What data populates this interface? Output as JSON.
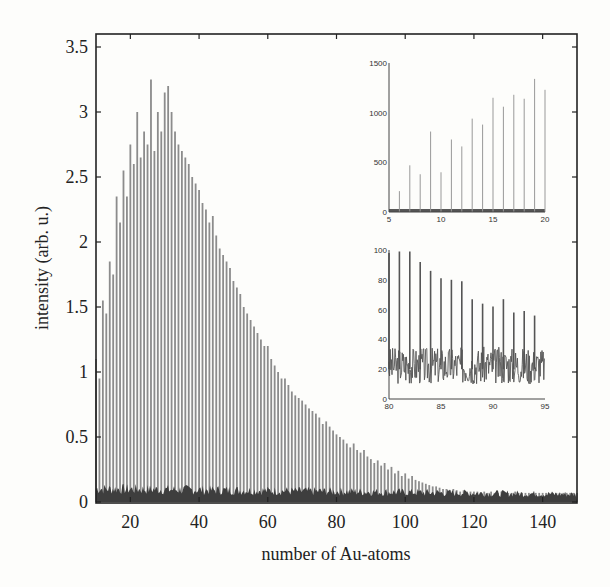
{
  "chart_data": [
    {
      "type": "bar",
      "title": "",
      "xlabel": "number of Au-atoms",
      "ylabel": "intensity (arb. u.)",
      "xlim": [
        10,
        150
      ],
      "ylim": [
        0,
        3.6
      ],
      "xticks": [
        20,
        40,
        60,
        80,
        100,
        120,
        140
      ],
      "yticks": [
        0,
        0.5,
        1,
        1.5,
        2,
        2.5,
        3,
        3.5
      ],
      "ytick_labels": [
        "0",
        "0.5",
        "1",
        "1.5",
        "2",
        "2.5",
        "3",
        "3.5"
      ],
      "grid": false,
      "legend": null,
      "x": [
        10,
        11,
        12,
        13,
        14,
        15,
        16,
        17,
        18,
        19,
        20,
        21,
        22,
        23,
        24,
        25,
        26,
        27,
        28,
        29,
        30,
        31,
        32,
        33,
        34,
        35,
        36,
        37,
        38,
        39,
        40,
        41,
        42,
        43,
        44,
        45,
        46,
        47,
        48,
        49,
        50,
        51,
        52,
        53,
        54,
        55,
        56,
        57,
        58,
        59,
        60,
        61,
        62,
        63,
        64,
        65,
        66,
        67,
        68,
        69,
        70,
        71,
        72,
        73,
        74,
        75,
        76,
        77,
        78,
        79,
        80,
        81,
        82,
        83,
        84,
        85,
        86,
        87,
        88,
        89,
        90,
        91,
        92,
        93,
        94,
        95,
        96,
        97,
        98,
        99,
        100,
        101,
        102,
        103,
        104,
        105,
        106,
        107,
        108,
        109,
        110,
        111,
        112,
        113,
        114,
        115,
        116,
        117,
        118,
        119,
        120,
        121,
        122,
        123,
        124,
        125,
        126,
        127,
        128,
        129,
        130,
        131,
        132,
        133,
        134,
        135,
        136,
        137,
        138,
        139,
        140,
        141,
        142,
        143,
        144,
        145,
        146,
        147,
        148,
        149,
        150
      ],
      "series": [
        {
          "name": "cluster peaks",
          "values": [
            1.1,
            0.95,
            1.55,
            1.45,
            1.85,
            1.75,
            2.35,
            2.15,
            2.55,
            2.35,
            2.75,
            2.6,
            3.0,
            2.65,
            2.85,
            2.75,
            3.25,
            2.7,
            3.0,
            2.85,
            3.15,
            3.2,
            3.0,
            2.85,
            2.75,
            2.7,
            2.65,
            2.6,
            2.5,
            2.45,
            2.4,
            2.3,
            2.25,
            2.15,
            2.2,
            2.05,
            1.95,
            1.9,
            1.85,
            1.8,
            1.7,
            1.65,
            1.6,
            1.5,
            1.45,
            1.4,
            1.35,
            1.3,
            1.25,
            1.2,
            1.2,
            1.1,
            1.05,
            1.0,
            0.95,
            0.95,
            0.9,
            0.85,
            0.82,
            0.8,
            0.78,
            0.75,
            0.72,
            0.7,
            0.68,
            0.65,
            0.6,
            0.62,
            0.58,
            0.55,
            0.52,
            0.5,
            0.48,
            0.45,
            0.42,
            0.45,
            0.4,
            0.38,
            0.4,
            0.35,
            0.33,
            0.3,
            0.32,
            0.28,
            0.3,
            0.25,
            0.27,
            0.22,
            0.24,
            0.2,
            0.22,
            0.18,
            0.2,
            0.17,
            0.16,
            0.15,
            0.14,
            0.13,
            0.12,
            0.12,
            0.11,
            0.1,
            0.1,
            0.09,
            0.1,
            0.09,
            0.08,
            0.09,
            0.08,
            0.08,
            0.08,
            0.08,
            0.07,
            0.08,
            0.07,
            0.08,
            0.07,
            0.07,
            0.08,
            0.07,
            0.07,
            0.07,
            0.08,
            0.07,
            0.07,
            0.07,
            0.07,
            0.07,
            0.07,
            0.07,
            0.07,
            0.07,
            0.07,
            0.07,
            0.07,
            0.07,
            0.07,
            0.07,
            0.07,
            0.07,
            0.07
          ]
        },
        {
          "name": "background",
          "values_approx": 0.1
        }
      ]
    },
    {
      "type": "line",
      "title": "inset top",
      "xlim": [
        5,
        20
      ],
      "ylim": [
        0,
        1500
      ],
      "xticks": [
        5,
        10,
        15,
        20
      ],
      "yticks": [
        0,
        500,
        1000,
        1500
      ],
      "x": [
        6,
        7,
        8,
        9,
        10,
        11,
        12,
        13,
        14,
        15,
        16,
        17,
        18,
        19,
        20
      ],
      "peaks": [
        210,
        470,
        380,
        810,
        400,
        730,
        660,
        940,
        880,
        1150,
        1060,
        1180,
        1140,
        1340,
        1230
      ],
      "baseline": 30
    },
    {
      "type": "line",
      "title": "inset bottom",
      "xlim": [
        80,
        95
      ],
      "ylim": [
        0,
        100
      ],
      "xticks": [
        80,
        85,
        90,
        95
      ],
      "yticks": [
        0,
        20,
        40,
        60,
        80,
        100
      ],
      "x": [
        80,
        81,
        82,
        83,
        84,
        85,
        86,
        87,
        88,
        89,
        90,
        91,
        92,
        93,
        94
      ],
      "peaks": [
        98,
        99,
        99,
        92,
        86,
        81,
        80,
        79,
        67,
        64,
        62,
        67,
        58,
        59,
        56
      ],
      "baseline_range": [
        10,
        35
      ]
    }
  ],
  "axes": {
    "xlabel": "number of Au-atoms",
    "ylabel": "intensity (arb. u.)"
  },
  "colors": {
    "bar": "#8a8a8a",
    "background_noise": "#3c3c3c",
    "axis": "#222222",
    "page": "#fdfdfb"
  }
}
